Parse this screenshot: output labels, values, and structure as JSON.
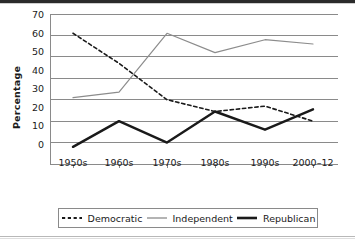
{
  "chart_data": {
    "type": "line",
    "title": "",
    "xlabel": "",
    "ylabel": "Percentage",
    "categories": [
      "1950s",
      "1960s",
      "1970s",
      "1980s",
      "1990s",
      "2000–12"
    ],
    "ylim": [
      0,
      70
    ],
    "yticks": [
      0,
      10,
      20,
      30,
      40,
      50,
      60,
      70
    ],
    "grid": true,
    "legend_position": "bottom",
    "series": [
      {
        "name": "Democratic",
        "style": "dashed",
        "color": "#1a1a1a",
        "width": 1.6,
        "values": [
          61,
          47,
          30,
          24.5,
          27,
          20
        ]
      },
      {
        "name": "Independent",
        "style": "solid",
        "color": "#8c8c8c",
        "width": 1.2,
        "values": [
          31,
          33.5,
          61,
          52,
          58,
          56
        ]
      },
      {
        "name": "Republican",
        "style": "solid",
        "color": "#1a1a1a",
        "width": 2.4,
        "values": [
          8,
          20,
          10,
          24.5,
          16,
          25.5
        ]
      }
    ]
  },
  "axis": {
    "ytick_labels": [
      "70",
      "60",
      "50",
      "40",
      "30",
      "20",
      "10",
      "0"
    ],
    "ylabel_text": "Percentage"
  },
  "legend": {
    "items": [
      {
        "label": "Democratic",
        "style": "dashed"
      },
      {
        "label": "Independent",
        "style": "thin"
      },
      {
        "label": "Republican",
        "style": "thick"
      }
    ]
  },
  "colors": {
    "grid": "#8a8a8a",
    "axis": "#8a8a8a",
    "text": "#1a1a1a",
    "independent": "#8c8c8c",
    "dark": "#1a1a1a",
    "background": "#ffffff"
  }
}
